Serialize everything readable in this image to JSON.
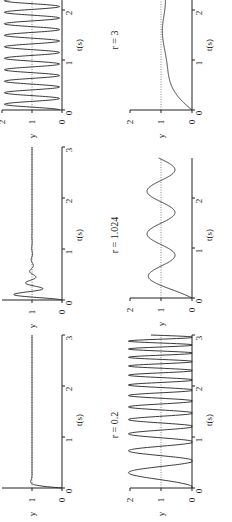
{
  "figure": {
    "orientation": "rotated 90deg counter-clockwise",
    "line_color": "#222222",
    "reference_color": "#555555"
  },
  "chart_data": [
    {
      "id": "top-left",
      "type": "line",
      "title": "",
      "xlabel": "t(s)",
      "ylabel": "y",
      "xlim": [
        0,
        3
      ],
      "ylim": [
        0,
        2
      ],
      "xticks": [
        "0",
        "1",
        "2",
        "3"
      ],
      "yticks": [
        "0",
        "1",
        "2"
      ],
      "reference_line": {
        "y": 1,
        "style": "dotted"
      },
      "description": "sustained oscillation around y=1 between ~0 and ~2, roughly 4.3 cycles per second",
      "series": [
        {
          "name": "response",
          "x": [
            0,
            0.12,
            0.23,
            0.35,
            0.46,
            0.58,
            0.69,
            0.81,
            0.92,
            1.04,
            1.15,
            1.27,
            1.38,
            1.5,
            1.62,
            1.73,
            1.85,
            1.96,
            2.08,
            2.19,
            2.31,
            2.42
          ],
          "y": [
            0,
            1.9,
            0.1,
            1.9,
            0.1,
            1.9,
            0.1,
            1.9,
            0.1,
            1.9,
            0.1,
            1.9,
            0.1,
            1.9,
            0.1,
            1.9,
            0.1,
            1.9,
            0.1,
            1.9,
            0.1,
            1.9
          ]
        }
      ]
    },
    {
      "id": "middle-left",
      "type": "line",
      "title": "",
      "xlabel": "t(s)",
      "ylabel": "y",
      "xlim": [
        0,
        3
      ],
      "ylim": [
        0,
        2
      ],
      "xticks": [
        "0",
        "1",
        "2",
        "3"
      ],
      "yticks": [
        "0",
        "1"
      ],
      "reference_line": {
        "y": 1,
        "style": "dotted"
      },
      "description": "fast rise with small decaying ripple, settles at 1 by t≈0.9",
      "series": [
        {
          "name": "response",
          "x": [
            0,
            0.1,
            0.2,
            0.3,
            0.4,
            0.5,
            0.6,
            0.7,
            0.8,
            0.9,
            1.0,
            3.0
          ],
          "y": [
            0,
            1.0,
            1.35,
            0.85,
            1.2,
            0.9,
            1.1,
            0.95,
            1.04,
            1.0,
            1.0,
            1.0
          ]
        }
      ]
    },
    {
      "id": "bottom-left",
      "type": "line",
      "title": "",
      "xlabel": "t(s)",
      "ylabel": "y",
      "xlim": [
        0,
        3
      ],
      "ylim": [
        0,
        2
      ],
      "xticks": [
        "0",
        "1",
        "2",
        "3"
      ],
      "yticks": [
        "0",
        "1"
      ],
      "reference_line": {
        "y": 1,
        "style": "dotted"
      },
      "description": "very fast rise with slight overshoot, settles at 1 by t≈0.2",
      "series": [
        {
          "name": "response",
          "x": [
            0,
            0.05,
            0.1,
            0.15,
            0.2,
            3.0
          ],
          "y": [
            0,
            0.8,
            1.1,
            1.02,
            1.0,
            1.0
          ]
        }
      ]
    },
    {
      "id": "top-right",
      "type": "line",
      "title": "r = 3",
      "xlabel": "t(s)",
      "ylabel": "y",
      "xlim": [
        0,
        3
      ],
      "ylim": [
        0,
        2
      ],
      "xticks": [
        "0",
        "1",
        "2",
        "3"
      ],
      "yticks": [
        "0",
        "1",
        "2"
      ],
      "reference_line": {
        "y": 1,
        "style": "dotted"
      },
      "description": "slow overdamped-like rise with mild undulation approaching ~0.9",
      "series": [
        {
          "name": "response",
          "x": [
            0,
            0.2,
            0.4,
            0.6,
            0.8,
            1.0,
            1.2,
            1.4,
            1.6,
            1.8,
            2.0,
            2.2,
            2.4
          ],
          "y": [
            0,
            0.2,
            0.5,
            0.7,
            0.75,
            0.74,
            0.8,
            0.9,
            0.88,
            0.86,
            0.9,
            0.92,
            0.92
          ]
        }
      ]
    },
    {
      "id": "middle-right",
      "type": "line",
      "title": "r = 1.024",
      "xlabel": "t(s)",
      "ylabel": "y",
      "xlim": [
        0,
        3
      ],
      "ylim": [
        0,
        2
      ],
      "xticks": [
        "0",
        "1",
        "2",
        "3"
      ],
      "yticks": [
        "0",
        "1",
        "2"
      ],
      "reference_line": {
        "y": 1,
        "style": "dotted"
      },
      "description": "oscillation around 1 with amplitude ~0.35-0.45, period ~0.85 s",
      "series": [
        {
          "name": "response",
          "x": [
            0,
            0.2,
            0.4,
            0.6,
            0.8,
            1.0,
            1.2,
            1.45,
            1.7,
            1.9,
            2.1,
            2.3,
            2.55,
            2.8
          ],
          "y": [
            0,
            0.4,
            1.0,
            1.4,
            1.1,
            0.6,
            0.7,
            1.4,
            1.1,
            0.6,
            0.7,
            1.4,
            1.2,
            0.7
          ]
        }
      ]
    },
    {
      "id": "bottom-right",
      "type": "line",
      "title": "r = 0.2",
      "xlabel": "t(s)",
      "ylabel": "y",
      "xlim": [
        0,
        3
      ],
      "ylim": [
        0,
        2
      ],
      "xticks": [
        "0",
        "1",
        "2",
        "3"
      ],
      "yticks": [
        "0",
        "1",
        "2"
      ],
      "reference_line": {
        "y": 1,
        "style": "dotted"
      },
      "description": "one slow hump peaking ~1.9 at t≈0.35, then increasingly fast oscillations between 0 and beyond 2 (clipped)",
      "series": [
        {
          "name": "response",
          "x": [
            0,
            0.35,
            0.65,
            0.85,
            1.05,
            1.2,
            1.35,
            1.5,
            1.65,
            1.8,
            1.95,
            2.1,
            2.25,
            2.4,
            2.55,
            2.7,
            2.85,
            3.0
          ],
          "y": [
            0,
            1.9,
            0,
            2.0,
            0,
            2.0,
            0,
            2.0,
            0,
            2.0,
            0,
            2.0,
            0,
            2.0,
            0,
            2.0,
            0,
            2.0
          ]
        }
      ]
    }
  ],
  "labels": {
    "xlabel": "t(s)",
    "ylabel": "y",
    "titles": [
      "r = 3",
      "r = 1.024",
      "r = 0.2"
    ],
    "tick_0": "0",
    "tick_1": "1",
    "tick_2": "2",
    "tick_3": "3"
  }
}
